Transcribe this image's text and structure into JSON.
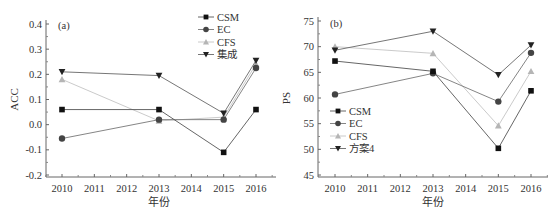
{
  "chart_data": [
    {
      "type": "line",
      "panel_label": "(a)",
      "title": "",
      "xlabel": "年份",
      "ylabel": "ACC",
      "x": [
        2010,
        2013,
        2015,
        2016
      ],
      "x_ticks": [
        "2010",
        "2011",
        "2012",
        "2013",
        "2014",
        "2015",
        "2016"
      ],
      "y_ticks": [
        "-0.2",
        "-0.1",
        "0.0",
        "0.1",
        "0.2",
        "0.3",
        "0.4"
      ],
      "ylim": [
        -0.2,
        0.4
      ],
      "xlim": [
        2009.5,
        2016.5
      ],
      "grid": false,
      "legend_position": "upper right",
      "series": [
        {
          "name": "CSM",
          "marker": "square",
          "color": "#111111",
          "line": "#555555",
          "values": [
            0.06,
            0.06,
            -0.11,
            0.06
          ]
        },
        {
          "name": "EC",
          "marker": "circle",
          "color": "#444444",
          "line": "#777777",
          "values": [
            -0.055,
            0.02,
            0.02,
            0.225
          ]
        },
        {
          "name": "CFS",
          "marker": "triangle-up",
          "color": "#b5b5b5",
          "line": "#c4c4c4",
          "values": [
            0.18,
            0.015,
            0.03,
            0.24
          ]
        },
        {
          "name": "集成",
          "marker": "triangle-down",
          "color": "#222222",
          "line": "#666666",
          "values": [
            0.21,
            0.195,
            0.045,
            0.255
          ]
        }
      ]
    },
    {
      "type": "line",
      "panel_label": "(b)",
      "title": "",
      "xlabel": "年份",
      "ylabel": "PS",
      "x": [
        2010,
        2013,
        2015,
        2016
      ],
      "x_ticks": [
        "2010",
        "2011",
        "2012",
        "2013",
        "2014",
        "2015",
        "2016"
      ],
      "y_ticks": [
        "45",
        "50",
        "55",
        "60",
        "65",
        "70",
        "75"
      ],
      "ylim": [
        45,
        75
      ],
      "xlim": [
        2009.5,
        2016.5
      ],
      "grid": false,
      "legend_position": "lower left",
      "series": [
        {
          "name": "CSM",
          "marker": "square",
          "color": "#111111",
          "line": "#555555",
          "values": [
            67.2,
            65.2,
            50.2,
            61.4
          ]
        },
        {
          "name": "EC",
          "marker": "circle",
          "color": "#444444",
          "line": "#777777",
          "values": [
            60.7,
            64.8,
            59.3,
            68.8
          ]
        },
        {
          "name": "CFS",
          "marker": "triangle-up",
          "color": "#b5b5b5",
          "line": "#c4c4c4",
          "values": [
            70.0,
            68.7,
            54.6,
            65.2
          ]
        },
        {
          "name": "方案4",
          "marker": "triangle-down",
          "color": "#222222",
          "line": "#666666",
          "values": [
            69.3,
            73.0,
            64.5,
            70.3
          ]
        }
      ]
    }
  ]
}
